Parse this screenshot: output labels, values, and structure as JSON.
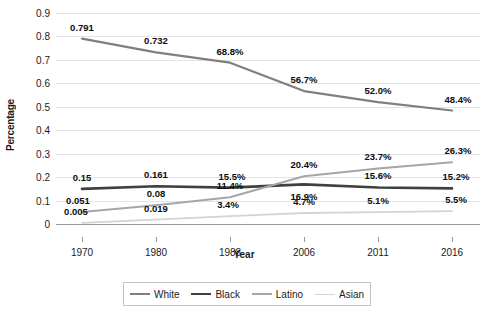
{
  "chart_data": {
    "type": "line",
    "title": "",
    "xlabel": "Year",
    "ylabel": "Percentage",
    "categories": [
      "1970",
      "1980",
      "1988",
      "2006",
      "2011",
      "2016"
    ],
    "ylim": [
      0,
      0.9
    ],
    "ytick_labels": [
      "0",
      "0.1",
      "0.2",
      "0.3",
      "0.4",
      "0.5",
      "0.6",
      "0.7",
      "0.8",
      "0.9"
    ],
    "ytick_values": [
      0,
      0.1,
      0.2,
      0.3,
      0.4,
      0.5,
      0.6,
      0.7,
      0.8,
      0.9
    ],
    "grid": true,
    "legend_position": "bottom",
    "series": [
      {
        "name": "White",
        "color": "#7f7f7f",
        "width": 2.2,
        "values": [
          0.791,
          0.732,
          0.688,
          0.567,
          0.52,
          0.484
        ],
        "labels": [
          "0.791",
          "0.732",
          "68.8%",
          "56.7%",
          "52.0%",
          "48.4%"
        ]
      },
      {
        "name": "Black",
        "color": "#404040",
        "width": 2.6,
        "values": [
          0.15,
          0.161,
          0.155,
          0.169,
          0.156,
          0.152
        ],
        "labels": [
          "0.15",
          "0.161",
          "15.5%",
          "16.9%",
          "15.6%",
          "15.2%"
        ]
      },
      {
        "name": "Latino",
        "color": "#a6a6a6",
        "width": 2.0,
        "values": [
          0.051,
          0.08,
          0.114,
          0.204,
          0.237,
          0.263
        ],
        "labels": [
          "0.051",
          "0.08",
          "11.4%",
          "20.4%",
          "23.7%",
          "26.3%"
        ]
      },
      {
        "name": "Asian",
        "color": "#d4d4d4",
        "width": 1.8,
        "values": [
          0.005,
          0.019,
          0.034,
          0.047,
          0.051,
          0.055
        ],
        "labels": [
          "0.005",
          "0.019",
          "3.4%",
          "4.7%",
          "5.1%",
          "5.5%"
        ]
      }
    ],
    "label_offsets": {
      "White": [
        [
          0,
          -6
        ],
        [
          0,
          -6
        ],
        [
          0,
          -6
        ],
        [
          0,
          -6
        ],
        [
          0,
          -6
        ],
        [
          6,
          -6
        ]
      ],
      "Black": [
        [
          0,
          -6
        ],
        [
          0,
          -6
        ],
        [
          2,
          -6
        ],
        [
          0,
          18
        ],
        [
          0,
          -6
        ],
        [
          4,
          -6
        ]
      ],
      "Latino": [
        [
          -4,
          -6
        ],
        [
          0,
          -6
        ],
        [
          0,
          -6
        ],
        [
          0,
          -6
        ],
        [
          0,
          -6
        ],
        [
          6,
          -6
        ]
      ],
      "Asian": [
        [
          -6,
          -6
        ],
        [
          0,
          -6
        ],
        [
          -2,
          -6
        ],
        [
          0,
          -6
        ],
        [
          0,
          -6
        ],
        [
          4,
          -6
        ]
      ]
    }
  },
  "legend": {
    "items": [
      {
        "label": "White",
        "color": "#7f7f7f",
        "width": 2.2
      },
      {
        "label": "Black",
        "color": "#404040",
        "width": 2.6
      },
      {
        "label": "Latino",
        "color": "#a6a6a6",
        "width": 2.0
      },
      {
        "label": "Asian",
        "color": "#d4d4d4",
        "width": 1.8
      }
    ]
  }
}
